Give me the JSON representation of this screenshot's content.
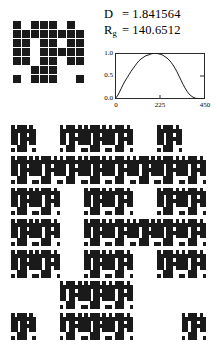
{
  "figure": {
    "title": "",
    "background_color": "#ffffff",
    "ink_color": "#1a1a1a"
  },
  "stats": {
    "dimension": {
      "symbol": "D",
      "subscript": "",
      "equals": "=",
      "value": "1.841564"
    },
    "gyration": {
      "symbol": "R",
      "subscript": "g",
      "equals": "=",
      "value": "140.6512"
    }
  },
  "seed": {
    "label": "generator-motif",
    "grid_size": 8,
    "cell_px": 8,
    "gap_px": 1,
    "filled_count": 39,
    "rows": [
      "10111010",
      "11111111",
      "11011011",
      "11011111",
      "11011011",
      "00111000",
      "10111001",
      "00000000"
    ]
  },
  "chart_data": {
    "type": "line",
    "title": "",
    "xlabel": "",
    "ylabel": "",
    "xlim": [
      0,
      450
    ],
    "ylim": [
      0.0,
      1.0
    ],
    "grid": false,
    "legend": "none",
    "xticks": [
      0,
      225,
      450
    ],
    "xtick_labels": [
      "0",
      "225",
      "450"
    ],
    "yticks": [
      0.0,
      0.5,
      1.0
    ],
    "ytick_labels": [
      "0.0",
      "0.5",
      "1.0"
    ],
    "series": [
      {
        "name": "density-profile",
        "color": "#1a1a1a",
        "x": [
          0,
          10,
          20,
          30,
          40,
          50,
          60,
          70,
          80,
          90,
          100,
          110,
          120,
          130,
          140,
          150,
          160,
          170,
          180,
          190,
          200,
          210,
          220,
          230,
          240,
          250,
          260,
          270,
          280,
          290,
          300,
          310,
          320,
          330,
          340,
          350,
          360,
          370,
          380,
          390,
          400,
          410,
          420,
          430,
          440,
          450
        ],
        "y": [
          0.01,
          0.05,
          0.13,
          0.22,
          0.31,
          0.39,
          0.46,
          0.53,
          0.6,
          0.66,
          0.72,
          0.78,
          0.83,
          0.87,
          0.9,
          0.93,
          0.95,
          0.96,
          0.98,
          0.99,
          1.0,
          0.99,
          0.98,
          0.97,
          0.95,
          0.92,
          0.89,
          0.85,
          0.8,
          0.74,
          0.67,
          0.59,
          0.5,
          0.41,
          0.32,
          0.24,
          0.17,
          0.11,
          0.07,
          0.04,
          0.02,
          0.01,
          0.01,
          0.0,
          0.0,
          0.0
        ]
      }
    ]
  },
  "fractal": {
    "label": "second-iteration-fractal",
    "iteration": 2,
    "grid_size": 64,
    "rule": "seed-substitution",
    "width_px": 195,
    "height_px": 215
  }
}
